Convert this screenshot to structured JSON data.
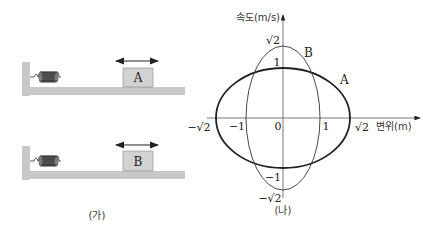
{
  "panel_ga": {
    "caption": "(가)",
    "systems": [
      {
        "block_label": "A"
      },
      {
        "block_label": "B"
      }
    ]
  },
  "panel_na": {
    "caption": "(나)",
    "y_axis_label": "속도(m/s)",
    "x_axis_label": "변위(m)",
    "x_ticks": {
      "neg_sqrt2": "−√2",
      "neg1": "−1",
      "zero": "0",
      "pos1": "1",
      "pos_sqrt2": "√2"
    },
    "y_ticks": {
      "pos_sqrt2": "√2",
      "pos1": "1",
      "neg1": "−1",
      "neg_sqrt2": "−√2"
    },
    "curves": [
      {
        "name": "A",
        "x_amplitude": "√2",
        "v_amplitude": "1"
      },
      {
        "name": "B",
        "x_amplitude": "1",
        "v_amplitude": "√2"
      }
    ]
  },
  "colors": {
    "ground": "#c8c8c8",
    "block": "#d2d2d2",
    "line": "#222222"
  }
}
